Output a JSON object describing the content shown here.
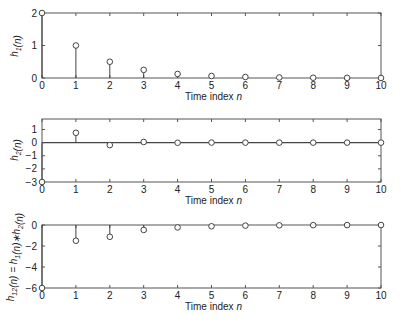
{
  "chart_data": [
    {
      "type": "stem",
      "panel": "top",
      "title": "",
      "xlabel": "Time index n",
      "ylabel": "h1(n)",
      "ylabel_parts": {
        "base": "h",
        "sub": "1",
        "arg": "(n)"
      },
      "x": [
        0,
        1,
        2,
        3,
        4,
        5,
        6,
        7,
        8,
        9,
        10
      ],
      "values": [
        2,
        1,
        0.5,
        0.25,
        0.125,
        0.0625,
        0.031,
        0.016,
        0.008,
        0.004,
        0.002
      ],
      "xlim": [
        0,
        10
      ],
      "ylim": [
        0,
        2
      ],
      "xticks": [
        "0",
        "1",
        "2",
        "3",
        "4",
        "5",
        "6",
        "7",
        "8",
        "9",
        "10"
      ],
      "yticks": [
        {
          "value": 0,
          "label": "0"
        },
        {
          "value": 1,
          "label": "1"
        },
        {
          "value": 2,
          "label": "2"
        }
      ],
      "grid": false,
      "marker": "open-circle"
    },
    {
      "type": "stem",
      "panel": "middle",
      "title": "",
      "xlabel": "Time index n",
      "ylabel": "h2(n)",
      "ylabel_parts": {
        "base": "h",
        "sub": "2",
        "arg": "(n)"
      },
      "x": [
        0,
        1,
        2,
        3,
        4,
        5,
        6,
        7,
        8,
        9,
        10
      ],
      "values": [
        -3,
        0.75,
        -0.19,
        0.05,
        -0.01,
        0.003,
        -0.001,
        0,
        0,
        0,
        0
      ],
      "xlim": [
        0,
        10
      ],
      "ylim": [
        -3,
        1.8
      ],
      "xticks": [
        "0",
        "1",
        "2",
        "3",
        "4",
        "5",
        "6",
        "7",
        "8",
        "9",
        "10"
      ],
      "yticks": [
        {
          "value": 1,
          "label": "1"
        },
        {
          "value": 0,
          "label": "0"
        },
        {
          "value": -1,
          "label": "−1"
        },
        {
          "value": -2,
          "label": "−2"
        },
        {
          "value": -3,
          "label": "−3"
        }
      ],
      "grid": false,
      "marker": "open-circle"
    },
    {
      "type": "stem",
      "panel": "bottom",
      "title": "",
      "xlabel": "Time index n",
      "ylabel": "h12(n) = h1(n)*h2(n)",
      "ylabel_parts": {
        "lhs_base": "h",
        "lhs_sub": "12",
        "eq": "(n) = ",
        "a_base": "h",
        "a_sub": "1",
        "op": "(n)∗",
        "b_base": "h",
        "b_sub": "2",
        "b_arg": "(n)"
      },
      "x": [
        0,
        1,
        2,
        3,
        4,
        5,
        6,
        7,
        8,
        9,
        10
      ],
      "values": [
        -6,
        -1.5,
        -1.125,
        -0.47,
        -0.23,
        -0.12,
        -0.06,
        -0.03,
        -0.015,
        -0.007,
        -0.004
      ],
      "xlim": [
        0,
        10
      ],
      "ylim": [
        -6,
        0
      ],
      "xticks": [
        "0",
        "1",
        "2",
        "3",
        "4",
        "5",
        "6",
        "7",
        "8",
        "9",
        "10"
      ],
      "yticks": [
        {
          "value": 0,
          "label": "0"
        },
        {
          "value": -2,
          "label": "−2"
        },
        {
          "value": -4,
          "label": "−4"
        },
        {
          "value": -6,
          "label": "−6"
        }
      ],
      "grid": false,
      "marker": "open-circle"
    }
  ],
  "colors": {
    "axis": "#555555",
    "stem": "#444444",
    "text": "#222222",
    "background": "#ffffff"
  }
}
